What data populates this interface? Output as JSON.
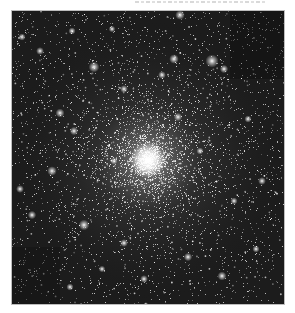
{
  "image": {
    "subject": "globular star cluster",
    "description": "Grayscale astronomical photograph of a dense globular star cluster with a bright core slightly below center",
    "caption_top": "",
    "frame": {
      "x": 12,
      "y": 11,
      "width": 272,
      "height": 293
    },
    "core": {
      "x": 136,
      "y": 149,
      "radius": 18
    },
    "background_color": "#1c1c1c",
    "page_background": "#ffffff",
    "dark_patches": [
      {
        "name": "upper-right-patch",
        "x": 218,
        "y": 0,
        "width": 54,
        "height": 68,
        "color": "#151515"
      },
      {
        "name": "lower-left-patch",
        "x": 0,
        "y": 236,
        "width": 48,
        "height": 57,
        "color": "#171717"
      }
    ],
    "bright_stars": [
      {
        "x": 168,
        "y": 4,
        "r": 1.6
      },
      {
        "x": 10,
        "y": 26,
        "r": 1.2
      },
      {
        "x": 28,
        "y": 40,
        "r": 1.3
      },
      {
        "x": 60,
        "y": 20,
        "r": 1.2
      },
      {
        "x": 100,
        "y": 18,
        "r": 1.1
      },
      {
        "x": 82,
        "y": 56,
        "r": 1.8
      },
      {
        "x": 112,
        "y": 78,
        "r": 1.3
      },
      {
        "x": 162,
        "y": 48,
        "r": 1.6
      },
      {
        "x": 212,
        "y": 58,
        "r": 1.4
      },
      {
        "x": 200,
        "y": 50,
        "r": 2.2
      },
      {
        "x": 150,
        "y": 64,
        "r": 1.3
      },
      {
        "x": 236,
        "y": 108,
        "r": 1.2
      },
      {
        "x": 48,
        "y": 102,
        "r": 1.5
      },
      {
        "x": 62,
        "y": 120,
        "r": 1.4
      },
      {
        "x": 40,
        "y": 160,
        "r": 1.6
      },
      {
        "x": 8,
        "y": 178,
        "r": 1.3
      },
      {
        "x": 20,
        "y": 204,
        "r": 1.4
      },
      {
        "x": 72,
        "y": 214,
        "r": 1.8
      },
      {
        "x": 112,
        "y": 232,
        "r": 1.3
      },
      {
        "x": 176,
        "y": 246,
        "r": 1.4
      },
      {
        "x": 210,
        "y": 265,
        "r": 1.5
      },
      {
        "x": 244,
        "y": 238,
        "r": 1.2
      },
      {
        "x": 250,
        "y": 170,
        "r": 1.3
      },
      {
        "x": 222,
        "y": 190,
        "r": 1.2
      },
      {
        "x": 132,
        "y": 268,
        "r": 1.3
      },
      {
        "x": 90,
        "y": 258,
        "r": 1.1
      },
      {
        "x": 58,
        "y": 276,
        "r": 1.2
      },
      {
        "x": 166,
        "y": 106,
        "r": 1.4
      },
      {
        "x": 102,
        "y": 150,
        "r": 1.2
      },
      {
        "x": 188,
        "y": 140,
        "r": 1.2
      }
    ],
    "star_field": {
      "seed": 42,
      "background_stars": 2600,
      "cluster_stars": 2200,
      "cluster_spread": 62
    }
  }
}
